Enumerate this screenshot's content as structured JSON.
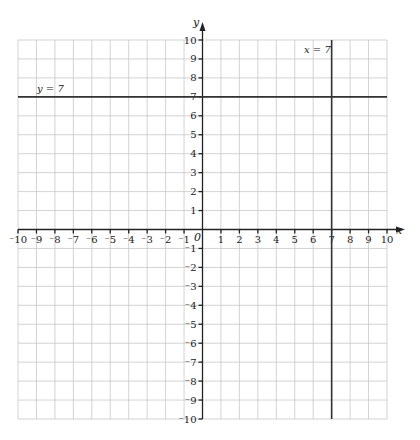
{
  "chart_data": {
    "type": "line",
    "title": "",
    "xlabel": "x",
    "ylabel": "y",
    "xlim": [
      -10,
      10
    ],
    "ylim": [
      -10,
      10
    ],
    "grid": true,
    "origin_label": "0",
    "x_ticks": [
      "⁻10",
      "⁻9",
      "⁻8",
      "⁻7",
      "⁻6",
      "⁻5",
      "⁻4",
      "⁻3",
      "⁻2",
      "⁻1",
      "1",
      "2",
      "3",
      "4",
      "5",
      "6",
      "7",
      "8",
      "9",
      "10"
    ],
    "y_ticks": [
      "10",
      "9",
      "8",
      "7",
      "6",
      "5",
      "4",
      "3",
      "2",
      "1",
      "⁻1",
      "⁻2",
      "⁻3",
      "⁻4",
      "⁻5",
      "⁻6",
      "⁻7",
      "⁻8",
      "⁻9",
      "⁻10"
    ],
    "series": [
      {
        "name": "y = 7",
        "type": "horizontal",
        "value": 7
      },
      {
        "name": "x = 7",
        "type": "vertical",
        "value": 7
      }
    ]
  },
  "labels": {
    "x_axis": "x",
    "y_axis": "y",
    "origin": "0",
    "line_h": "y = 7",
    "line_v": "x = 7"
  }
}
